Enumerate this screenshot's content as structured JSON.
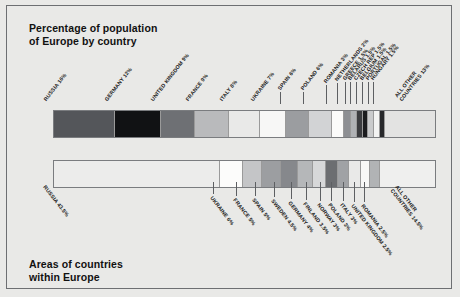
{
  "frame": {
    "border_color": "#6d6f72",
    "background": "#e9e9e7"
  },
  "charts": [
    {
      "id": "population",
      "title": "Percentage of population\nof Europe by country",
      "title_position": "top-left",
      "label_position": "above",
      "bar": {
        "x": 46,
        "y": 104,
        "width": 383,
        "height": 28
      }
    },
    {
      "id": "area",
      "title": "Areas of countries\nwithin Europe",
      "title_position": "bottom-left",
      "label_position": "below",
      "bar": {
        "x": 46,
        "y": 154,
        "width": 383,
        "height": 28
      }
    }
  ],
  "chart_data": [
    {
      "type": "bar",
      "orientation": "horizontal-stacked",
      "title": "Percentage of population of Europe by country",
      "xlabel": "",
      "ylabel": "",
      "unit": "%",
      "total": 100,
      "categories": [
        "RUSSIA",
        "GERMANY",
        "UNITED KINGDOM",
        "FRANCE",
        "ITALY",
        "UKRAINE",
        "SPAIN",
        "POLAND",
        "ROMANIA",
        "NETHERLANDS",
        "GREECE",
        "BELARUS",
        "CZECH REP",
        "BELGIUM",
        "PORTUGAL",
        "HUNGARY",
        "ALL OTHER COUNTRIES"
      ],
      "values": [
        16,
        12,
        9,
        9,
        8,
        7,
        6,
        6,
        3,
        2,
        1.5,
        1.5,
        1.5,
        1.5,
        1.5,
        1.5,
        13
      ],
      "labels": [
        "RUSSIA 16%",
        "GERMANY 12%",
        "UNITED KINGDOM 9%",
        "FRANCE 9%",
        "ITALY 8%",
        "UKRAINE 7%",
        "SPAIN 6%",
        "POLAND 6%",
        "ROMANIA 3%",
        "NETHERLANDS 2%",
        "GREECE 1.5%",
        "BELARUS 1.5%",
        "CZECH REP 1.5%",
        "BELGIUM 1.5%",
        "PORTUGAL 1.5%",
        "HUNGARY 1.5%",
        "ALL OTHER\nCOUNTRIES 13%"
      ],
      "colors": [
        "#54565a",
        "#111214",
        "#6e7074",
        "#b9babc",
        "#e4e4e3",
        "#f6f6f5",
        "#9a9c9f",
        "#d4d5d6",
        "#fbfbfa",
        "#8e9094",
        "#aeb0b3",
        "#3a3b3e",
        "#1b1c1e",
        "#c9cacb",
        "#f2f2f1",
        "#26272a",
        "#e2e2e1"
      ]
    },
    {
      "type": "bar",
      "orientation": "horizontal-stacked",
      "title": "Areas of countries within Europe",
      "xlabel": "",
      "ylabel": "",
      "unit": "%",
      "total": 100,
      "categories": [
        "RUSSIA",
        "UKRAINE",
        "FRANCE",
        "SPAIN",
        "SWEDEN",
        "GERMANY",
        "FINLAND",
        "NORWAY",
        "POLAND",
        "ITALY",
        "UNITED KINGDOM",
        "ROMANIA",
        "ALL OTHER COUNTRIES"
      ],
      "values": [
        43.5,
        6,
        5,
        5,
        4.5,
        4,
        3.5,
        3,
        3,
        3,
        2.5,
        2.5,
        14.5
      ],
      "labels": [
        "RUSSIA 43.5%",
        "UKRAINE 6%",
        "FRANCE 5%",
        "SPAIN 5%",
        "SWEDEN 4.5%",
        "GERMANY 4%",
        "FINLAND 3.5%",
        "NORWAY 3%",
        "POLAND 3%",
        "ITALY 3%",
        "UNITED KINGDOM 2.5%",
        "ROMANIA 2.5%",
        "ALL OTHER\nCOUNTRIES 14.5%"
      ],
      "colors": [
        "#ececeb",
        "#fbfbfa",
        "#c3c4c6",
        "#9b9d a0",
        "#86888c",
        "#b4b6b8",
        "#d6d7d8",
        "#6b6d70",
        "#9fa1a4",
        "#e8e8e7",
        "#f7f7f6",
        "#b0b2b4",
        "#eeeeed"
      ]
    }
  ]
}
